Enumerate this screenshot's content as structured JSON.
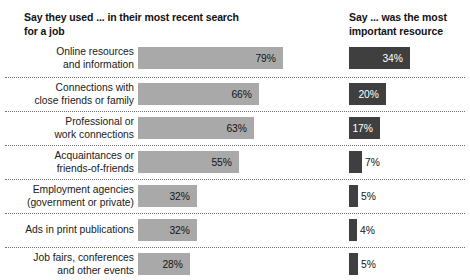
{
  "headings": {
    "left": "Say they used ... in their most recent search for a job",
    "right": "Say ... was the most important resource"
  },
  "chart_data": {
    "type": "bar",
    "title": "",
    "xlabel": "",
    "ylabel": "",
    "orientation": "horizontal",
    "grid": false,
    "legend": null,
    "xlim": [
      0,
      100
    ],
    "categories": [
      "Online resources and information",
      "Connections with close friends or family",
      "Professional or work connections",
      "Acquaintances or friends-of-friends",
      "Employment agencies (government or private)",
      "Ads in print publications",
      "Job fairs, conferences and other events"
    ],
    "series": [
      {
        "name": "Say they used ... in their most recent search for a job",
        "color": "#a9a9a9",
        "values": [
          79,
          66,
          63,
          55,
          32,
          32,
          28
        ],
        "labels": [
          "79%",
          "66%",
          "63%",
          "55%",
          "32%",
          "32%",
          "28%"
        ]
      },
      {
        "name": "Say ... was the most important resource",
        "color": "#3f3f3f",
        "values": [
          34,
          20,
          17,
          7,
          5,
          4,
          5
        ],
        "labels": [
          "34%",
          "20%",
          "17%",
          "7%",
          "5%",
          "4%",
          "5%"
        ]
      }
    ]
  },
  "rows": [
    {
      "label_line1": "Online resources",
      "label_line2": "and information",
      "left": {
        "value": 79,
        "label": "79%",
        "width_px": 145,
        "label_position": "inside"
      },
      "right": {
        "value": 34,
        "label": "34%",
        "width_px": 61,
        "label_position": "inside"
      }
    },
    {
      "label_line1": "Connections with",
      "label_line2": "close friends or family",
      "left": {
        "value": 66,
        "label": "66%",
        "width_px": 121,
        "label_position": "inside"
      },
      "right": {
        "value": 20,
        "label": "20%",
        "width_px": 37,
        "label_position": "inside"
      }
    },
    {
      "label_line1": "Professional or",
      "label_line2": "work connections",
      "left": {
        "value": 63,
        "label": "63%",
        "width_px": 116,
        "label_position": "inside"
      },
      "right": {
        "value": 17,
        "label": "17%",
        "width_px": 31,
        "label_position": "inside"
      }
    },
    {
      "label_line1": "Acquaintances or",
      "label_line2": "friends-of-friends",
      "left": {
        "value": 55,
        "label": "55%",
        "width_px": 101,
        "label_position": "inside"
      },
      "right": {
        "value": 7,
        "label": "7%",
        "width_px": 13,
        "label_position": "outside"
      }
    },
    {
      "label_line1": "Employment agencies",
      "label_line2": "(government or private)",
      "left": {
        "value": 32,
        "label": "32%",
        "width_px": 59,
        "label_position": "inside"
      },
      "right": {
        "value": 5,
        "label": "5%",
        "width_px": 9,
        "label_position": "outside"
      }
    },
    {
      "label_line1": "Ads in print publications",
      "label_line2": "",
      "left": {
        "value": 32,
        "label": "32%",
        "width_px": 59,
        "label_position": "inside"
      },
      "right": {
        "value": 4,
        "label": "4%",
        "width_px": 8,
        "label_position": "outside"
      }
    },
    {
      "label_line1": "Job fairs, conferences",
      "label_line2": "and other events",
      "left": {
        "value": 28,
        "label": "28%",
        "width_px": 52,
        "label_position": "inside"
      },
      "right": {
        "value": 5,
        "label": "5%",
        "width_px": 9,
        "label_position": "outside"
      }
    }
  ],
  "colors": {
    "light_bar": "#a9a9a9",
    "dark_bar": "#3f3f3f",
    "text": "#1a1a1a",
    "divider": "#6f6f6f",
    "background": "#ffffff"
  }
}
